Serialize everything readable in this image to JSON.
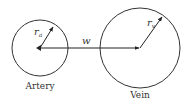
{
  "diagram": {
    "artery": {
      "label": "Artery",
      "radius_symbol": "r",
      "radius_subscript": "a"
    },
    "vein": {
      "label": "Vein",
      "radius_symbol": "r",
      "radius_subscript": "v"
    },
    "distance": {
      "symbol": "w"
    },
    "colors": {
      "stroke": "#333333",
      "background": "#ffffff"
    }
  }
}
